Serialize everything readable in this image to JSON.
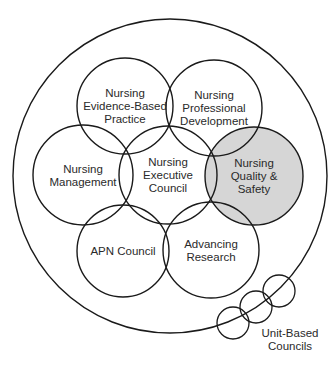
{
  "colors": {
    "stroke": "#1a1a1a",
    "highlight_fill": "#d6d6d6",
    "background": "#ffffff"
  },
  "outer_circle": {
    "cx": 170,
    "cy": 176,
    "r": 157
  },
  "councils": [
    {
      "id": "ebp",
      "lines": [
        "Nursing",
        "Evidence-Based",
        "Practice"
      ],
      "cx": 125,
      "cy": 106,
      "r": 48,
      "highlighted": false
    },
    {
      "id": "prof-dev",
      "lines": [
        "Nursing",
        "Professional",
        "Development"
      ],
      "cx": 214,
      "cy": 108,
      "r": 48,
      "highlighted": false
    },
    {
      "id": "management",
      "lines": [
        "Nursing",
        "Management"
      ],
      "cx": 83,
      "cy": 175,
      "r": 50,
      "highlighted": false
    },
    {
      "id": "executive",
      "lines": [
        "Nursing",
        "Executive",
        "Council"
      ],
      "cx": 168,
      "cy": 175,
      "r": 49,
      "highlighted": false
    },
    {
      "id": "quality-safety",
      "lines": [
        "Nursing",
        "Quality &",
        "Safety"
      ],
      "cx": 254,
      "cy": 176,
      "r": 49,
      "highlighted": true
    },
    {
      "id": "apn",
      "lines": [
        "APN Council"
      ],
      "cx": 123,
      "cy": 251,
      "r": 46,
      "highlighted": false
    },
    {
      "id": "research",
      "lines": [
        "Advancing",
        "Research"
      ],
      "cx": 211,
      "cy": 250,
      "r": 48,
      "highlighted": false
    }
  ],
  "unit_based": {
    "label_lines": [
      "Unit-Based",
      "Councils"
    ],
    "circles": [
      {
        "cx": 233,
        "cy": 323,
        "r": 16
      },
      {
        "cx": 256,
        "cy": 307,
        "r": 16
      },
      {
        "cx": 279,
        "cy": 291,
        "r": 16
      }
    ]
  }
}
